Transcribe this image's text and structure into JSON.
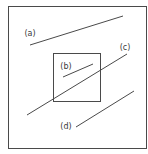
{
  "diagram": {
    "type": "line-clipping",
    "stroke_color": "#4a4a4a",
    "outer_box": {
      "x1": 8,
      "y1": 6,
      "x2": 146,
      "y2": 148
    },
    "clip_window": {
      "x1": 53,
      "y1": 53,
      "x2": 100,
      "y2": 101
    },
    "lines": [
      {
        "id": "a",
        "label": "(a)",
        "x1": 30,
        "y1": 45,
        "x2": 123,
        "y2": 16,
        "label_x": 30,
        "label_y": 36,
        "relation": "entirely outside"
      },
      {
        "id": "b",
        "label": "(b)",
        "x1": 63,
        "y1": 77,
        "x2": 93,
        "y2": 64,
        "label_x": 66,
        "label_y": 69,
        "relation": "entirely inside"
      },
      {
        "id": "c",
        "label": "(c)",
        "x1": 27,
        "y1": 115,
        "x2": 127,
        "y2": 54,
        "label_x": 125,
        "label_y": 50,
        "relation": "crosses window"
      },
      {
        "id": "d",
        "label": "(d)",
        "x1": 76,
        "y1": 127,
        "x2": 134,
        "y2": 91,
        "label_x": 66,
        "label_y": 129,
        "relation": "entirely outside"
      }
    ]
  }
}
